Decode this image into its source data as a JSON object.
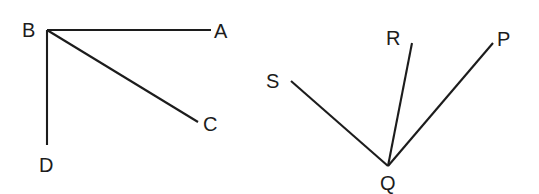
{
  "figure": {
    "background_color": "#ffffff",
    "line_color": "#1c1c1c",
    "label_color": "#1c1c1c",
    "diagrams": [
      {
        "name": "left-diagram",
        "vertex": "B",
        "vertex_point": {
          "x": 47,
          "y": 30
        },
        "vertex_label": {
          "text": "B",
          "x": 22,
          "y": 37
        },
        "rays": [
          {
            "name": "ray-BA",
            "endpoint_label": "A",
            "x1": 47,
            "y1": 30,
            "x2": 211,
            "y2": 30,
            "label_x": 214,
            "label_y": 38
          },
          {
            "name": "ray-BC",
            "endpoint_label": "C",
            "x1": 47,
            "y1": 30,
            "x2": 198,
            "y2": 122,
            "label_x": 203,
            "label_y": 131
          },
          {
            "name": "ray-BD",
            "endpoint_label": "D",
            "x1": 47,
            "y1": 30,
            "x2": 47,
            "y2": 145,
            "label_x": 39,
            "label_y": 172
          }
        ]
      },
      {
        "name": "right-diagram",
        "vertex": "Q",
        "vertex_point": {
          "x": 388,
          "y": 166
        },
        "vertex_label": {
          "text": "Q",
          "x": 380,
          "y": 190
        },
        "rays": [
          {
            "name": "ray-QS",
            "endpoint_label": "S",
            "x1": 388,
            "y1": 166,
            "x2": 291,
            "y2": 81,
            "label_x": 266,
            "label_y": 88
          },
          {
            "name": "ray-QR",
            "endpoint_label": "R",
            "x1": 388,
            "y1": 166,
            "x2": 412,
            "y2": 43,
            "label_x": 386,
            "label_y": 45
          },
          {
            "name": "ray-QP",
            "endpoint_label": "P",
            "x1": 388,
            "y1": 166,
            "x2": 493,
            "y2": 43,
            "label_x": 497,
            "label_y": 46
          }
        ]
      }
    ]
  }
}
